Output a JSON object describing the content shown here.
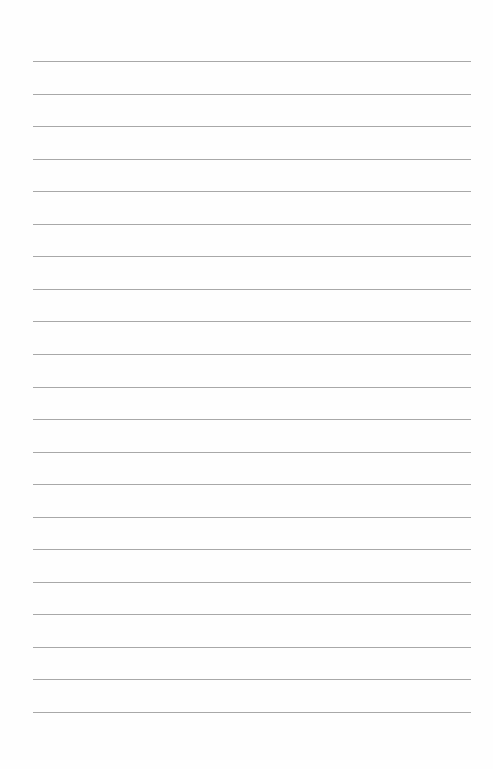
{
  "page": {
    "type": "lined-paper",
    "line_color": "#a8a8a8",
    "background": "#fefefe",
    "line_count": 21,
    "first_line_y": 61,
    "line_spacing": 32.55,
    "line_left": 33,
    "line_width": 438
  }
}
